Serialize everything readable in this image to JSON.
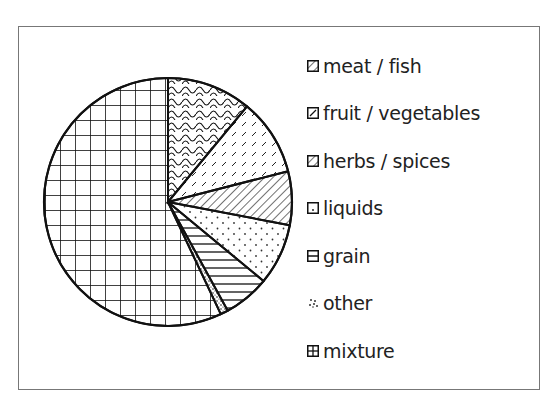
{
  "chart_data": {
    "type": "pie",
    "title": "",
    "start_angle_deg": 0,
    "direction": "clockwise",
    "legend_position": "right",
    "categories": [
      "meat / fish",
      "fruit / vegetables",
      "herbs / spices",
      "liquids",
      "grain",
      "other",
      "mixture"
    ],
    "values": [
      11,
      10,
      7,
      8,
      6,
      1,
      57
    ],
    "units": "percent (estimated)",
    "patterns": [
      "scales",
      "dashes",
      "diagonal-lines",
      "dots",
      "horizontal-lines",
      "speckle",
      "grid"
    ]
  },
  "legend": {
    "items": [
      {
        "label": "meat / fish",
        "pattern": "scales"
      },
      {
        "label": "fruit / vegetables",
        "pattern": "dashes"
      },
      {
        "label": "herbs / spices",
        "pattern": "diagonal-lines"
      },
      {
        "label": "liquids",
        "pattern": "dots"
      },
      {
        "label": "grain",
        "pattern": "horizontal-lines"
      },
      {
        "label": "other",
        "pattern": "speckle"
      },
      {
        "label": "mixture",
        "pattern": "grid"
      }
    ]
  },
  "colors": {
    "stroke": "#111111",
    "fill": "#ffffff",
    "frame": "#777777"
  }
}
